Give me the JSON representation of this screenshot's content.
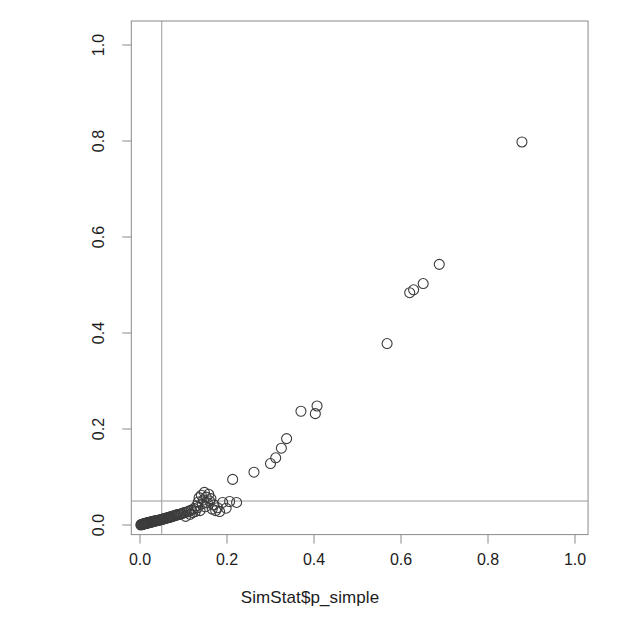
{
  "chart_data": {
    "type": "scatter",
    "title": "",
    "subtitle": "",
    "xlabel": "SimStat$p_simple",
    "ylabel": "SimStat$p_covariate",
    "xlim": [
      -0.02,
      1.03
    ],
    "ylim": [
      -0.02,
      1.05
    ],
    "xticks": [
      "0.0",
      "0.2",
      "0.4",
      "0.6",
      "0.8",
      "1.0"
    ],
    "xtick_values": [
      0.0,
      0.2,
      0.4,
      0.6,
      0.8,
      1.0
    ],
    "yticks": [
      "0.0",
      "0.2",
      "0.4",
      "0.6",
      "0.8",
      "1.0"
    ],
    "ytick_values": [
      0.0,
      0.2,
      0.4,
      0.6,
      0.8,
      1.0
    ],
    "grid": false,
    "legend": null,
    "legend_position": "none",
    "point_marker": "open-circle",
    "point_color": "#3c3c3c",
    "point_radius_px": 5,
    "frame_color": "#8a8a8a",
    "reference_lines": [
      {
        "name": "alpha-vline",
        "orientation": "vertical",
        "value": 0.05,
        "color": "#9a9a9a"
      },
      {
        "name": "alpha-hline",
        "orientation": "horizontal",
        "value": 0.05,
        "color": "#9a9a9a"
      }
    ],
    "series": [
      {
        "name": "simulations",
        "n_points": 104,
        "points": [
          [
            0.002,
            0.0
          ],
          [
            0.003,
            0.001
          ],
          [
            0.004,
            0.001
          ],
          [
            0.005,
            0.001
          ],
          [
            0.006,
            0.002
          ],
          [
            0.007,
            0.002
          ],
          [
            0.008,
            0.002
          ],
          [
            0.009,
            0.002
          ],
          [
            0.01,
            0.003
          ],
          [
            0.011,
            0.003
          ],
          [
            0.012,
            0.003
          ],
          [
            0.013,
            0.003
          ],
          [
            0.014,
            0.004
          ],
          [
            0.015,
            0.004
          ],
          [
            0.016,
            0.004
          ],
          [
            0.017,
            0.004
          ],
          [
            0.018,
            0.005
          ],
          [
            0.019,
            0.005
          ],
          [
            0.02,
            0.005
          ],
          [
            0.021,
            0.005
          ],
          [
            0.023,
            0.006
          ],
          [
            0.024,
            0.006
          ],
          [
            0.025,
            0.006
          ],
          [
            0.026,
            0.006
          ],
          [
            0.028,
            0.007
          ],
          [
            0.029,
            0.007
          ],
          [
            0.03,
            0.007
          ],
          [
            0.032,
            0.008
          ],
          [
            0.033,
            0.008
          ],
          [
            0.035,
            0.008
          ],
          [
            0.036,
            0.009
          ],
          [
            0.038,
            0.009
          ],
          [
            0.04,
            0.009
          ],
          [
            0.041,
            0.01
          ],
          [
            0.043,
            0.01
          ],
          [
            0.045,
            0.01
          ],
          [
            0.046,
            0.011
          ],
          [
            0.048,
            0.011
          ],
          [
            0.05,
            0.012
          ],
          [
            0.052,
            0.012
          ],
          [
            0.054,
            0.013
          ],
          [
            0.056,
            0.013
          ],
          [
            0.058,
            0.014
          ],
          [
            0.06,
            0.014
          ],
          [
            0.062,
            0.015
          ],
          [
            0.064,
            0.015
          ],
          [
            0.066,
            0.016
          ],
          [
            0.068,
            0.016
          ],
          [
            0.07,
            0.017
          ],
          [
            0.072,
            0.017
          ],
          [
            0.074,
            0.018
          ],
          [
            0.077,
            0.019
          ],
          [
            0.079,
            0.019
          ],
          [
            0.082,
            0.02
          ],
          [
            0.084,
            0.021
          ],
          [
            0.086,
            0.021
          ],
          [
            0.089,
            0.022
          ],
          [
            0.091,
            0.022
          ],
          [
            0.094,
            0.023
          ],
          [
            0.096,
            0.024
          ],
          [
            0.099,
            0.025
          ],
          [
            0.102,
            0.026
          ],
          [
            0.105,
            0.018
          ],
          [
            0.108,
            0.027
          ],
          [
            0.112,
            0.029
          ],
          [
            0.115,
            0.022
          ],
          [
            0.118,
            0.031
          ],
          [
            0.121,
            0.026
          ],
          [
            0.124,
            0.034
          ],
          [
            0.127,
            0.028
          ],
          [
            0.13,
            0.04
          ],
          [
            0.132,
            0.036
          ],
          [
            0.134,
            0.048
          ],
          [
            0.136,
            0.057
          ],
          [
            0.138,
            0.03
          ],
          [
            0.141,
            0.062
          ],
          [
            0.143,
            0.044
          ],
          [
            0.146,
            0.052
          ],
          [
            0.148,
            0.068
          ],
          [
            0.15,
            0.038
          ],
          [
            0.152,
            0.058
          ],
          [
            0.155,
            0.046
          ],
          [
            0.158,
            0.064
          ],
          [
            0.16,
            0.05
          ],
          [
            0.163,
            0.055
          ],
          [
            0.166,
            0.033
          ],
          [
            0.17,
            0.042
          ],
          [
            0.174,
            0.03
          ],
          [
            0.178,
            0.036
          ],
          [
            0.183,
            0.028
          ],
          [
            0.19,
            0.047
          ],
          [
            0.198,
            0.035
          ],
          [
            0.206,
            0.049
          ],
          [
            0.213,
            0.095
          ],
          [
            0.222,
            0.047
          ],
          [
            0.262,
            0.11
          ],
          [
            0.3,
            0.128
          ],
          [
            0.312,
            0.14
          ],
          [
            0.325,
            0.16
          ],
          [
            0.337,
            0.18
          ],
          [
            0.37,
            0.237
          ],
          [
            0.403,
            0.232
          ],
          [
            0.407,
            0.248
          ],
          [
            0.568,
            0.378
          ],
          [
            0.62,
            0.484
          ],
          [
            0.629,
            0.49
          ],
          [
            0.651,
            0.503
          ],
          [
            0.688,
            0.543
          ],
          [
            0.878,
            0.798
          ]
        ]
      }
    ]
  },
  "axes": {
    "x_title": "SimStat$p_simple",
    "y_title": "SimStat$p_covariate",
    "x_tick_labels": [
      "0.0",
      "0.2",
      "0.4",
      "0.6",
      "0.8",
      "1.0"
    ],
    "y_tick_labels": [
      "0.0",
      "0.2",
      "0.4",
      "0.6",
      "0.8",
      "1.0"
    ]
  }
}
